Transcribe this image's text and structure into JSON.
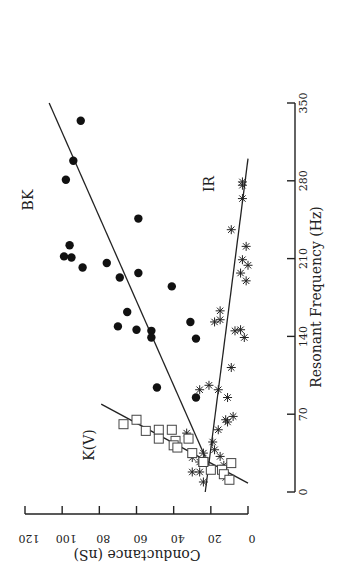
{
  "chart_data": {
    "type": "scatter",
    "orientation": "rotated 90deg counter-clockwise",
    "title": "",
    "xlabel": "Resonant Frequency (Hz)",
    "ylabel": "Conductance (nS)",
    "xlim": [
      0,
      350
    ],
    "ylim": [
      0,
      120
    ],
    "x_ticks": [
      "0",
      "70",
      "140",
      "210",
      "280",
      "350"
    ],
    "y_ticks": [
      "0",
      "20",
      "40",
      "60",
      "80",
      "100",
      "120"
    ],
    "grid": false,
    "legend": "inline labels",
    "series": [
      {
        "name": "BK",
        "marker": "filled-circle",
        "points": [
          [
            334,
            90
          ],
          [
            298,
            94
          ],
          [
            281,
            98
          ],
          [
            246,
            59
          ],
          [
            222,
            96
          ],
          [
            212,
            99
          ],
          [
            211,
            95
          ],
          [
            202,
            89
          ],
          [
            206,
            76
          ],
          [
            193,
            69
          ],
          [
            197,
            59
          ],
          [
            185,
            41
          ],
          [
            162,
            65
          ],
          [
            149,
            70
          ],
          [
            146,
            60
          ],
          [
            145,
            52
          ],
          [
            139,
            52
          ],
          [
            153,
            31
          ],
          [
            138,
            28
          ],
          [
            94,
            49
          ],
          [
            85,
            28
          ]
        ],
        "fit_line": [
          [
            20,
            20
          ],
          [
            350,
            107
          ]
        ]
      },
      {
        "name": "IR",
        "marker": "asterisk",
        "points": [
          [
            279,
            3
          ],
          [
            276,
            3
          ],
          [
            264,
            3
          ],
          [
            236,
            9
          ],
          [
            221,
            1
          ],
          [
            209,
            3
          ],
          [
            204,
            0
          ],
          [
            197,
            4
          ],
          [
            190,
            1
          ],
          [
            163,
            15
          ],
          [
            153,
            18
          ],
          [
            155,
            15
          ],
          [
            145,
            7
          ],
          [
            146,
            4
          ],
          [
            139,
            2
          ],
          [
            112,
            9
          ],
          [
            92,
            26
          ],
          [
            96,
            21
          ],
          [
            92,
            16
          ],
          [
            85,
            11
          ],
          [
            68,
            8
          ],
          [
            65,
            12
          ],
          [
            63,
            11
          ],
          [
            56,
            16
          ],
          [
            53,
            33
          ],
          [
            45,
            19
          ],
          [
            38,
            18
          ],
          [
            32,
            15
          ],
          [
            35,
            24
          ],
          [
            31,
            30
          ],
          [
            27,
            26
          ],
          [
            18,
            30
          ],
          [
            18,
            26
          ],
          [
            9,
            24
          ],
          [
            13,
            12
          ],
          [
            24,
            13
          ]
        ],
        "fit_line": [
          [
            0,
            23
          ],
          [
            300,
            0
          ]
        ]
      },
      {
        "name": "K(V)",
        "marker": "open-square",
        "points": [
          [
            61,
            67
          ],
          [
            65,
            60
          ],
          [
            55,
            55
          ],
          [
            56,
            48
          ],
          [
            48,
            48
          ],
          [
            56,
            41
          ],
          [
            46,
            39
          ],
          [
            42,
            40
          ],
          [
            40,
            38
          ],
          [
            48,
            32
          ],
          [
            35,
            30
          ],
          [
            27,
            24
          ],
          [
            20,
            20
          ],
          [
            27,
            24
          ],
          [
            20,
            14
          ],
          [
            26,
            9
          ],
          [
            16,
            13
          ],
          [
            11,
            10
          ]
        ],
        "fit_line": [
          [
            79,
            79
          ],
          [
            8,
            0
          ]
        ]
      }
    ],
    "annotations": [
      "BK",
      "IR",
      "K(V)"
    ]
  }
}
